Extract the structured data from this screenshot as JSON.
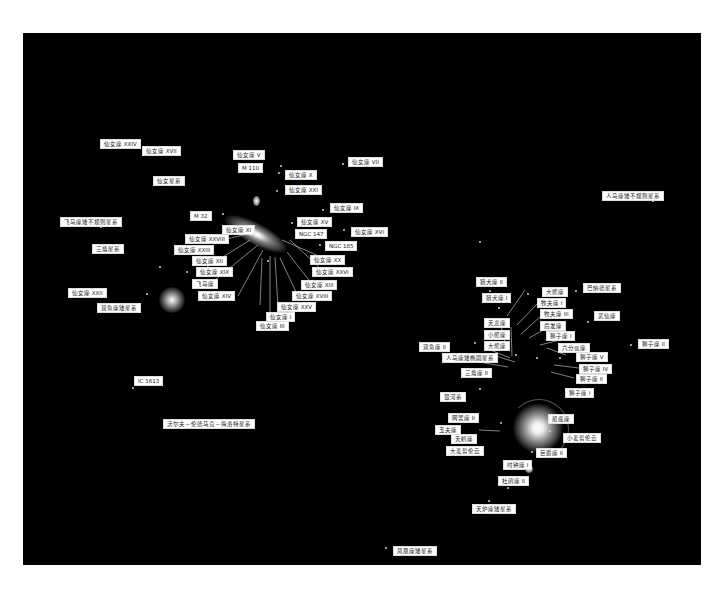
{
  "diagram": {
    "background_color": "#000000",
    "label_bg": "#ffffff",
    "label_fg": "#222222"
  },
  "labels": [
    {
      "id": "and-xxiv",
      "text": "仙女座 XXIV",
      "x": 100,
      "y": 139
    },
    {
      "id": "and-xvii",
      "text": "仙女座 XVII",
      "x": 142,
      "y": 146
    },
    {
      "id": "and-v",
      "text": "仙女座 V",
      "x": 233,
      "y": 150
    },
    {
      "id": "m110",
      "text": "M 110",
      "x": 238,
      "y": 163
    },
    {
      "id": "and-vii",
      "text": "仙女座 VII",
      "x": 348,
      "y": 157
    },
    {
      "id": "and-x",
      "text": "仙女座 X",
      "x": 285,
      "y": 170
    },
    {
      "id": "andromeda",
      "text": "仙女星系",
      "x": 153,
      "y": 176
    },
    {
      "id": "and-xxi",
      "text": "仙女座 XXI",
      "x": 285,
      "y": 185
    },
    {
      "id": "and-ix",
      "text": "仙女座 IX",
      "x": 330,
      "y": 203
    },
    {
      "id": "m32",
      "text": "M 32",
      "x": 190,
      "y": 211
    },
    {
      "id": "and-xv",
      "text": "仙女座 XV",
      "x": 297,
      "y": 217
    },
    {
      "id": "pegasus-dirr",
      "text": "飞马座矮不规则星系",
      "x": 60,
      "y": 217
    },
    {
      "id": "and-xi",
      "text": "仙女座 XI",
      "x": 222,
      "y": 225
    },
    {
      "id": "and-xvi",
      "text": "仙女座 XVI",
      "x": 351,
      "y": 227
    },
    {
      "id": "ngc147",
      "text": "NGC 147",
      "x": 295,
      "y": 229
    },
    {
      "id": "and-xxviii",
      "text": "仙女座 XXVIII",
      "x": 185,
      "y": 234
    },
    {
      "id": "ngc185",
      "text": "NGC 185",
      "x": 325,
      "y": 241
    },
    {
      "id": "triangulum",
      "text": "三角星系",
      "x": 92,
      "y": 244
    },
    {
      "id": "and-xxiii",
      "text": "仙女座 XXIII",
      "x": 174,
      "y": 245
    },
    {
      "id": "and-xii",
      "text": "仙女座 XII",
      "x": 192,
      "y": 256
    },
    {
      "id": "and-xx",
      "text": "仙女座 XX",
      "x": 310,
      "y": 255
    },
    {
      "id": "and-xix",
      "text": "仙女座 XIX",
      "x": 196,
      "y": 267
    },
    {
      "id": "and-xxvi",
      "text": "仙女座 XXVI",
      "x": 312,
      "y": 267
    },
    {
      "id": "pegasus-dsph",
      "text": "飞马座",
      "x": 192,
      "y": 279
    },
    {
      "id": "and-xiii",
      "text": "仙女座 XIII",
      "x": 301,
      "y": 280
    },
    {
      "id": "and-xxii",
      "text": "仙女座 XXII",
      "x": 68,
      "y": 288
    },
    {
      "id": "and-xiv",
      "text": "仙女座 XIV",
      "x": 198,
      "y": 291
    },
    {
      "id": "and-xviii",
      "text": "仙女座 XVIII",
      "x": 292,
      "y": 291
    },
    {
      "id": "and-xxv",
      "text": "仙女座 XXV",
      "x": 277,
      "y": 302
    },
    {
      "id": "pisces-dwarf",
      "text": "双鱼座矮星系",
      "x": 97,
      "y": 303
    },
    {
      "id": "and-i",
      "text": "仙女座 I",
      "x": 266,
      "y": 312
    },
    {
      "id": "and-iii",
      "text": "仙女座 III",
      "x": 256,
      "y": 321
    },
    {
      "id": "ic1613",
      "text": "IC 1613",
      "x": 134,
      "y": 376
    },
    {
      "id": "wlm",
      "text": "沃尔夫－伦德马克－梅洛特星系",
      "x": 163,
      "y": 419
    },
    {
      "id": "ant-2x",
      "text": "猎犬座 II",
      "x": 476,
      "y": 277
    },
    {
      "id": "ursa-major",
      "text": "大熊座",
      "x": 542,
      "y": 287
    },
    {
      "id": "leo-t-ish",
      "text": "巴纳德星系",
      "x": 583,
      "y": 283
    },
    {
      "id": "cvn-i",
      "text": "猎犬座 I",
      "x": 482,
      "y": 293
    },
    {
      "id": "bootes-i",
      "text": "牧夫座 I",
      "x": 537,
      "y": 298
    },
    {
      "id": "bootes-ii",
      "text": "牧夫座 III",
      "x": 540,
      "y": 309
    },
    {
      "id": "sextans-b",
      "text": "武仙座",
      "x": 594,
      "y": 311
    },
    {
      "id": "draco",
      "text": "天龙座",
      "x": 484,
      "y": 318
    },
    {
      "id": "hercules",
      "text": "后发座",
      "x": 540,
      "y": 321
    },
    {
      "id": "ursa-minor",
      "text": "小熊座",
      "x": 484,
      "y": 330
    },
    {
      "id": "leo-i",
      "text": "狮子座 I",
      "x": 546,
      "y": 331
    },
    {
      "id": "leo-ii",
      "text": "狮子座 II",
      "x": 638,
      "y": 339
    },
    {
      "id": "pisces-ii",
      "text": "双鱼座 II",
      "x": 419,
      "y": 342
    },
    {
      "id": "ursa-major-ii",
      "text": "大熊座",
      "x": 484,
      "y": 341
    },
    {
      "id": "sextans",
      "text": "六分仪座",
      "x": 558,
      "y": 343
    },
    {
      "id": "sgr-deg",
      "text": "人马座矮椭圆星系",
      "x": 442,
      "y": 353
    },
    {
      "id": "leo-v",
      "text": "狮子座 V",
      "x": 576,
      "y": 352
    },
    {
      "id": "leo-iv",
      "text": "狮子座 IV",
      "x": 579,
      "y": 364
    },
    {
      "id": "triangulum-ii",
      "text": "三角座 II",
      "x": 461,
      "y": 368
    },
    {
      "id": "leo-iii",
      "text": "狮子座 II",
      "x": 576,
      "y": 374
    },
    {
      "id": "leo-a",
      "text": "狮子座 I",
      "x": 565,
      "y": 388
    },
    {
      "id": "milky-way",
      "text": "银河系",
      "x": 440,
      "y": 392
    },
    {
      "id": "reticulum-ii",
      "text": "网罟座 II",
      "x": 448,
      "y": 413
    },
    {
      "id": "carina",
      "text": "船底座",
      "x": 548,
      "y": 414
    },
    {
      "id": "sculptor",
      "text": "玉夫座",
      "x": 435,
      "y": 425
    },
    {
      "id": "phoenix-ii",
      "text": "天鹤座",
      "x": 451,
      "y": 434
    },
    {
      "id": "smc",
      "text": "小麦哲伦云",
      "x": 563,
      "y": 433
    },
    {
      "id": "lmc",
      "text": "大麦哲伦云",
      "x": 446,
      "y": 446
    },
    {
      "id": "grus-ii",
      "text": "巨爵座 II",
      "x": 536,
      "y": 448
    },
    {
      "id": "horologium-i",
      "text": "时钟座 I",
      "x": 503,
      "y": 460
    },
    {
      "id": "tucana-ii",
      "text": "杜鹃座 II",
      "x": 498,
      "y": 476
    },
    {
      "id": "fornax",
      "text": "天炉座矮星系",
      "x": 472,
      "y": 504
    },
    {
      "id": "sag-dirr",
      "text": "人马座矮不规则星系",
      "x": 602,
      "y": 191
    },
    {
      "id": "phoenix",
      "text": "凤凰座矮星系",
      "x": 393,
      "y": 546
    }
  ],
  "stars": [
    {
      "x": 235,
      "y": 152
    },
    {
      "x": 280,
      "y": 165
    },
    {
      "x": 342,
      "y": 163
    },
    {
      "x": 159,
      "y": 266
    },
    {
      "x": 278,
      "y": 172
    },
    {
      "x": 276,
      "y": 190
    },
    {
      "x": 322,
      "y": 209
    },
    {
      "x": 291,
      "y": 222
    },
    {
      "x": 343,
      "y": 229
    },
    {
      "x": 222,
      "y": 213
    },
    {
      "x": 250,
      "y": 234
    },
    {
      "x": 319,
      "y": 244
    },
    {
      "x": 100,
      "y": 226
    },
    {
      "x": 146,
      "y": 293
    },
    {
      "x": 186,
      "y": 271
    },
    {
      "x": 267,
      "y": 260
    },
    {
      "x": 132,
      "y": 387
    },
    {
      "x": 652,
      "y": 200
    },
    {
      "x": 479,
      "y": 241
    },
    {
      "x": 489,
      "y": 290
    },
    {
      "x": 498,
      "y": 307
    },
    {
      "x": 527,
      "y": 293
    },
    {
      "x": 575,
      "y": 290
    },
    {
      "x": 587,
      "y": 321
    },
    {
      "x": 630,
      "y": 344
    },
    {
      "x": 559,
      "y": 357
    },
    {
      "x": 536,
      "y": 357
    },
    {
      "x": 506,
      "y": 348
    },
    {
      "x": 515,
      "y": 354
    },
    {
      "x": 500,
      "y": 422
    },
    {
      "x": 549,
      "y": 430
    },
    {
      "x": 531,
      "y": 451
    },
    {
      "x": 507,
      "y": 487
    },
    {
      "x": 488,
      "y": 500
    },
    {
      "x": 385,
      "y": 547
    },
    {
      "x": 479,
      "y": 388
    },
    {
      "x": 474,
      "y": 342
    }
  ],
  "leader_lines": [
    [
      223,
      240,
      255,
      232
    ],
    [
      207,
      267,
      250,
      240
    ],
    [
      215,
      280,
      258,
      245
    ],
    [
      238,
      296,
      263,
      250
    ],
    [
      260,
      305,
      262,
      258
    ],
    [
      270,
      316,
      270,
      256
    ],
    [
      278,
      307,
      275,
      257
    ],
    [
      298,
      296,
      280,
      258
    ],
    [
      312,
      284,
      287,
      252
    ],
    [
      328,
      260,
      282,
      240
    ],
    [
      322,
      270,
      290,
      240
    ],
    [
      507,
      316,
      525,
      290
    ],
    [
      517,
      325,
      538,
      303
    ],
    [
      521,
      334,
      541,
      316
    ],
    [
      529,
      338,
      547,
      328
    ],
    [
      540,
      345,
      560,
      340
    ],
    [
      547,
      348,
      566,
      355
    ],
    [
      554,
      365,
      579,
      368
    ],
    [
      551,
      372,
      574,
      378
    ],
    [
      488,
      349,
      510,
      358
    ],
    [
      496,
      356,
      515,
      362
    ],
    [
      473,
      361,
      508,
      367
    ],
    [
      479,
      430,
      500,
      431
    ],
    [
      500,
      322,
      507,
      350
    ],
    [
      511,
      327,
      512,
      356
    ]
  ]
}
